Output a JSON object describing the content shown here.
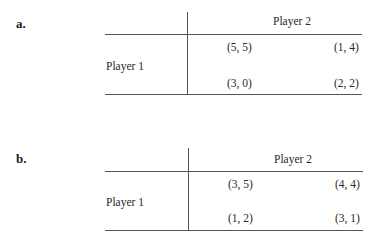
{
  "games": [
    {
      "label": "a.",
      "column_player": "Player 2",
      "row_player": "Player 1",
      "payoffs": [
        [
          "(5, 5)",
          "(1, 4)"
        ],
        [
          "(3, 0)",
          "(2, 2)"
        ]
      ]
    },
    {
      "label": "b.",
      "column_player": "Player 2",
      "row_player": "Player 1",
      "payoffs": [
        [
          "(3, 5)",
          "(4, 4)"
        ],
        [
          "(1, 2)",
          "(3, 1)"
        ]
      ]
    }
  ]
}
